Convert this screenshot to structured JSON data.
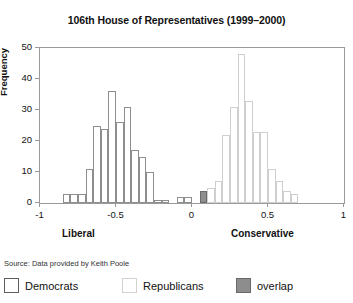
{
  "chart_data": {
    "type": "bar",
    "title": "106th House of Representatives (1999–2000)",
    "xlabel": "",
    "ylabel": "Frequency",
    "xlim": [
      -1,
      1
    ],
    "ylim": [
      0,
      50
    ],
    "grid": false,
    "bin_width": 0.05,
    "x_ticks": [
      "-1",
      "-0.5",
      "0",
      "0.5",
      "1"
    ],
    "x_tick_values": [
      -1,
      -0.5,
      0,
      0.5,
      1
    ],
    "y_ticks": [
      "0",
      "10",
      "20",
      "30",
      "40",
      "50"
    ],
    "y_tick_values": [
      0,
      10,
      20,
      30,
      40,
      50
    ],
    "pole_label_left": "Liberal",
    "pole_label_right": "Conservative",
    "legend_position": "below-figure",
    "series": [
      {
        "name": "Democrats",
        "style": "dem",
        "bins": [
          {
            "x0": -0.85,
            "x1": -0.8,
            "value": 3
          },
          {
            "x0": -0.8,
            "x1": -0.75,
            "value": 3
          },
          {
            "x0": -0.75,
            "x1": -0.7,
            "value": 3
          },
          {
            "x0": -0.7,
            "x1": -0.65,
            "value": 11
          },
          {
            "x0": -0.65,
            "x1": -0.6,
            "value": 25
          },
          {
            "x0": -0.6,
            "x1": -0.55,
            "value": 24
          },
          {
            "x0": -0.55,
            "x1": -0.5,
            "value": 36
          },
          {
            "x0": -0.5,
            "x1": -0.45,
            "value": 26
          },
          {
            "x0": -0.45,
            "x1": -0.4,
            "value": 31
          },
          {
            "x0": -0.4,
            "x1": -0.35,
            "value": 17
          },
          {
            "x0": -0.35,
            "x1": -0.3,
            "value": 15
          },
          {
            "x0": -0.3,
            "x1": -0.25,
            "value": 10
          },
          {
            "x0": -0.25,
            "x1": -0.2,
            "value": 1
          },
          {
            "x0": -0.2,
            "x1": -0.15,
            "value": 1
          },
          {
            "x0": -0.1,
            "x1": -0.05,
            "value": 2
          },
          {
            "x0": -0.05,
            "x1": 0.0,
            "value": 2
          },
          {
            "x0": 0.05,
            "x1": 0.1,
            "value": 4
          }
        ]
      },
      {
        "name": "Republicans",
        "style": "rep",
        "bins": [
          {
            "x0": 0.05,
            "x1": 0.1,
            "value": 4
          },
          {
            "x0": 0.1,
            "x1": 0.15,
            "value": 5
          },
          {
            "x0": 0.15,
            "x1": 0.2,
            "value": 7
          },
          {
            "x0": 0.2,
            "x1": 0.25,
            "value": 22
          },
          {
            "x0": 0.25,
            "x1": 0.3,
            "value": 31
          },
          {
            "x0": 0.3,
            "x1": 0.35,
            "value": 48
          },
          {
            "x0": 0.35,
            "x1": 0.4,
            "value": 33
          },
          {
            "x0": 0.4,
            "x1": 0.45,
            "value": 23
          },
          {
            "x0": 0.45,
            "x1": 0.5,
            "value": 23
          },
          {
            "x0": 0.5,
            "x1": 0.55,
            "value": 11
          },
          {
            "x0": 0.55,
            "x1": 0.6,
            "value": 7
          },
          {
            "x0": 0.6,
            "x1": 0.65,
            "value": 4
          },
          {
            "x0": 0.65,
            "x1": 0.7,
            "value": 3
          }
        ]
      },
      {
        "name": "overlap",
        "style": "overlap",
        "bins": [
          {
            "x0": 0.05,
            "x1": 0.1,
            "value": 4
          }
        ]
      }
    ]
  },
  "source": {
    "note": "Source: Data provided by Keith Poole"
  },
  "legend": {
    "items": [
      {
        "label": "Democrats",
        "style": "dem",
        "color": "#ffffff"
      },
      {
        "label": "Republicans",
        "style": "rep",
        "color": "#ffffff"
      },
      {
        "label": "overlap",
        "style": "overlap",
        "color": "#8d8d8d"
      }
    ]
  }
}
